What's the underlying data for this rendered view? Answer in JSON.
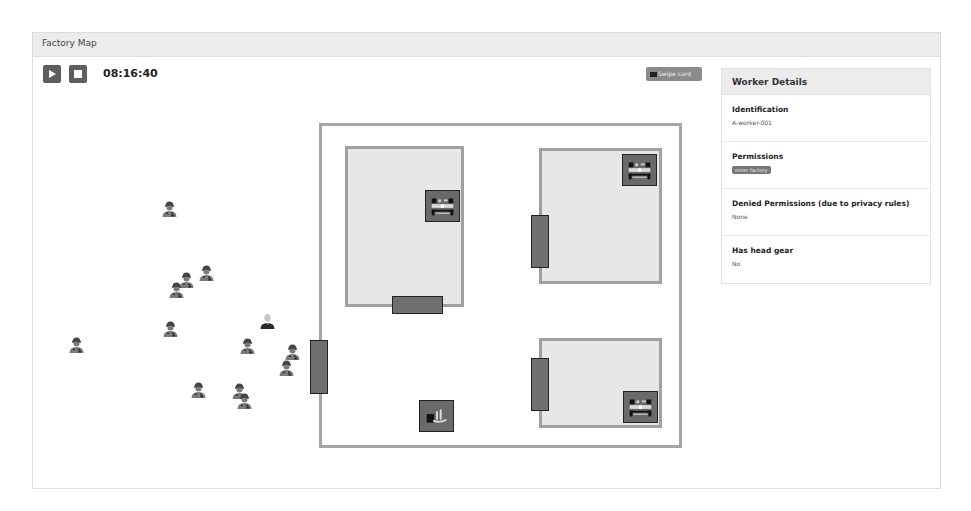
{
  "window": {
    "title": "Factory Map"
  },
  "controls": {
    "play_icon": "play-icon",
    "stop_icon": "stop-icon",
    "clock": "08:16:40",
    "swipe_card_label": "Swipe card",
    "swipe_card_icon": "id-card-icon"
  },
  "worker_details": {
    "title": "Worker Details",
    "identification_label": "Identification",
    "identification_value": "A-worker-001",
    "permissions_label": "Permissions",
    "permissions_badge": "enter factory",
    "denied_label": "Denied Permissions (due to privacy rules)",
    "denied_value": "None",
    "headgear_label": "Has head gear",
    "headgear_value": "No"
  },
  "colors": {
    "button_dark": "#5e5e5e",
    "room_fill": "#e7e7e7",
    "room_border": "#a0a0a0",
    "door_fill": "#6f6f6f",
    "machine_fill": "#6a6a6a",
    "worker_fill": "#7a7a7a",
    "selected_worker_fill": "#2a2a2a"
  },
  "map": {
    "factory": {
      "x": 286,
      "y": 66,
      "w": 363,
      "h": 325
    },
    "rooms": [
      {
        "name": "room-top-left",
        "x": 312,
        "y": 89,
        "w": 119,
        "h": 161
      },
      {
        "name": "room-top-right",
        "x": 506,
        "y": 91,
        "w": 123,
        "h": 136
      },
      {
        "name": "room-bottom-right",
        "x": 506,
        "y": 281,
        "w": 123,
        "h": 90
      }
    ],
    "doors": [
      {
        "name": "factory-entrance-door",
        "x": 277,
        "y": 283,
        "w": 18,
        "h": 54
      },
      {
        "name": "room-top-left-door",
        "x": 359,
        "y": 239,
        "w": 51,
        "h": 18
      },
      {
        "name": "room-top-right-door",
        "x": 498,
        "y": 158,
        "w": 18,
        "h": 53
      },
      {
        "name": "room-bottom-right-door",
        "x": 498,
        "y": 301,
        "w": 18,
        "h": 53
      }
    ],
    "machines": [
      {
        "name": "machine-room-top-left",
        "type": "press-machine-icon",
        "x": 392,
        "y": 133,
        "w": 35,
        "h": 32
      },
      {
        "name": "machine-room-top-right",
        "type": "press-machine-icon",
        "x": 589,
        "y": 97,
        "w": 35,
        "h": 32
      },
      {
        "name": "machine-room-bottom-right",
        "type": "press-machine-icon",
        "x": 590,
        "y": 334,
        "w": 35,
        "h": 32
      },
      {
        "name": "helmet-dispenser",
        "type": "helmet-station-icon",
        "x": 386,
        "y": 343,
        "w": 35,
        "h": 32
      }
    ],
    "workers": [
      {
        "x": 128,
        "y": 143,
        "selected": false,
        "headgear": true
      },
      {
        "x": 165,
        "y": 207,
        "selected": false,
        "headgear": true
      },
      {
        "x": 145,
        "y": 214,
        "selected": false,
        "headgear": true
      },
      {
        "x": 135,
        "y": 224,
        "selected": false,
        "headgear": true
      },
      {
        "x": 129,
        "y": 263,
        "selected": false,
        "headgear": true
      },
      {
        "x": 35,
        "y": 279,
        "selected": false,
        "headgear": true
      },
      {
        "x": 226,
        "y": 255,
        "selected": true,
        "headgear": false
      },
      {
        "x": 206,
        "y": 280,
        "selected": false,
        "headgear": true
      },
      {
        "x": 251,
        "y": 286,
        "selected": false,
        "headgear": true
      },
      {
        "x": 245,
        "y": 302,
        "selected": false,
        "headgear": true
      },
      {
        "x": 157,
        "y": 324,
        "selected": false,
        "headgear": true
      },
      {
        "x": 198,
        "y": 325,
        "selected": false,
        "headgear": true
      },
      {
        "x": 203,
        "y": 335,
        "selected": false,
        "headgear": true
      }
    ]
  }
}
